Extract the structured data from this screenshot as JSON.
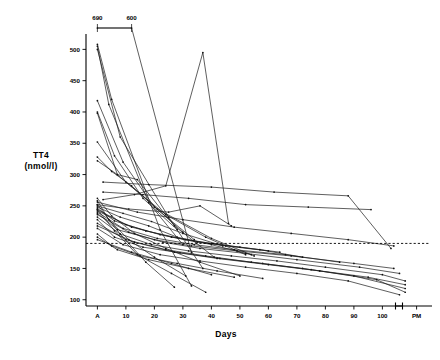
{
  "figure": {
    "kind": "spaghetti-line-chart",
    "background": "#ffffff",
    "ink": "#111111"
  },
  "axes": {
    "y_title_line1": "TT4",
    "y_title_line2": "(nmol/l)",
    "x_title": "Days",
    "y_ticks": [
      100,
      150,
      200,
      250,
      300,
      350,
      400,
      450,
      500
    ],
    "y_tick_labels": [
      "100",
      "150",
      "200",
      "250",
      "300",
      "350",
      "400",
      "450",
      "500"
    ],
    "x_ticks": [
      "A",
      "10",
      "20",
      "30",
      "40",
      "50",
      "60",
      "70",
      "80",
      "90",
      "100",
      "PM"
    ],
    "ylim": [
      90,
      515
    ],
    "xlim": [
      -4,
      116
    ],
    "grid": false,
    "legend": false
  },
  "annotations": {
    "offscale_labels": [
      "690",
      "600"
    ],
    "offscale_note": "two out-of-range values bracketed above the axis",
    "reference_line_value": 190,
    "reference_line_style": "dashed"
  },
  "chart_data": {
    "type": "line",
    "title": "",
    "subtitle": "",
    "xlabel": "Days",
    "ylabel": "TT4 (nmol/l)",
    "xlim": [
      -4,
      116
    ],
    "ylim": [
      90,
      515
    ],
    "grid": false,
    "legend_position": "none",
    "x_tick_labels": [
      "A",
      "10",
      "20",
      "30",
      "40",
      "50",
      "60",
      "70",
      "80",
      "90",
      "100",
      "PM"
    ],
    "x_tick_values": [
      0,
      10,
      20,
      30,
      40,
      50,
      60,
      70,
      80,
      90,
      100,
      112
    ],
    "y_ticks": [
      100,
      150,
      200,
      250,
      300,
      350,
      400,
      450,
      500
    ],
    "reference_lines": [
      {
        "orientation": "horizontal",
        "value": 190,
        "style": "dashed",
        "label": ""
      }
    ],
    "offscale_markers": [
      {
        "x": 0,
        "label": "690",
        "clipped_at": 515
      },
      {
        "x": 12,
        "label": "600",
        "clipped_at": 515
      }
    ],
    "series": [
      {
        "name": "s1",
        "x": [
          0,
          12,
          33
        ],
        "values": [
          690,
          600,
          175
        ]
      },
      {
        "name": "s2",
        "x": [
          0,
          5,
          22,
          33
        ],
        "values": [
          508,
          420,
          212,
          122
        ]
      },
      {
        "name": "s3",
        "x": [
          0,
          4,
          18,
          30
        ],
        "values": [
          505,
          412,
          255,
          188
        ]
      },
      {
        "name": "s4",
        "x": [
          0,
          8,
          25,
          37
        ],
        "values": [
          500,
          360,
          232,
          150
        ]
      },
      {
        "name": "s5",
        "x": [
          0,
          9,
          20,
          34
        ],
        "values": [
          418,
          320,
          248,
          196
        ]
      },
      {
        "name": "s6",
        "x": [
          0,
          6,
          16,
          28
        ],
        "values": [
          400,
          330,
          262,
          212
        ]
      },
      {
        "name": "s7",
        "x": [
          0,
          7,
          21,
          40,
          55
        ],
        "values": [
          398,
          300,
          245,
          198,
          170
        ]
      },
      {
        "name": "s8",
        "x": [
          0,
          10,
          24,
          38,
          52
        ],
        "values": [
          352,
          288,
          236,
          200,
          172
        ]
      },
      {
        "name": "s9",
        "x": [
          0,
          5,
          12,
          30
        ],
        "values": [
          328,
          305,
          282,
          208
        ]
      },
      {
        "name": "s10",
        "x": [
          0,
          7,
          14,
          27,
          41
        ],
        "values": [
          322,
          300,
          292,
          218,
          168
        ]
      },
      {
        "name": "s11",
        "x": [
          2,
          13,
          24,
          37,
          46
        ],
        "values": [
          260,
          268,
          282,
          495,
          222
        ]
      },
      {
        "name": "s12",
        "x": [
          0,
          11,
          25,
          36,
          47
        ],
        "values": [
          252,
          245,
          240,
          250,
          218
        ]
      },
      {
        "name": "s13",
        "x": [
          0,
          9,
          19,
          30,
          44
        ],
        "values": [
          250,
          238,
          225,
          206,
          186
        ]
      },
      {
        "name": "s14",
        "x": [
          0,
          8,
          18,
          28,
          40,
          54
        ],
        "values": [
          248,
          232,
          218,
          200,
          188,
          172
        ]
      },
      {
        "name": "s15",
        "x": [
          0,
          6,
          17,
          31,
          45,
          60
        ],
        "values": [
          246,
          226,
          210,
          196,
          186,
          178
        ]
      },
      {
        "name": "s16",
        "x": [
          0,
          10,
          22,
          35,
          50,
          64
        ],
        "values": [
          244,
          220,
          204,
          192,
          184,
          176
        ]
      },
      {
        "name": "s17",
        "x": [
          0,
          12,
          26,
          40,
          57,
          72
        ],
        "values": [
          242,
          216,
          200,
          190,
          180,
          168
        ]
      },
      {
        "name": "s18",
        "x": [
          0,
          9,
          21,
          34,
          48,
          66,
          85
        ],
        "values": [
          240,
          214,
          198,
          188,
          180,
          172,
          160
        ]
      },
      {
        "name": "s19",
        "x": [
          0,
          7,
          20,
          33,
          49,
          68,
          90,
          104
        ],
        "values": [
          238,
          212,
          196,
          186,
          178,
          170,
          158,
          150
        ]
      },
      {
        "name": "s20",
        "x": [
          0,
          11,
          23,
          36,
          52,
          70,
          92,
          106
        ],
        "values": [
          236,
          208,
          192,
          182,
          174,
          164,
          152,
          142
        ]
      },
      {
        "name": "s21",
        "x": [
          0,
          8,
          19,
          32,
          47,
          63,
          80,
          100,
          108
        ],
        "values": [
          232,
          205,
          188,
          178,
          170,
          162,
          152,
          140,
          130
        ]
      },
      {
        "name": "s22",
        "x": [
          0,
          6,
          16,
          29,
          43,
          58,
          75,
          95,
          108
        ],
        "values": [
          228,
          200,
          184,
          175,
          166,
          158,
          148,
          136,
          124
        ]
      },
      {
        "name": "s23",
        "x": [
          0,
          10,
          24,
          38,
          54,
          72,
          90,
          108
        ],
        "values": [
          222,
          196,
          180,
          170,
          160,
          150,
          138,
          118
        ]
      },
      {
        "name": "s24",
        "x": [
          0,
          13,
          27,
          42,
          60,
          78,
          98,
          108
        ],
        "values": [
          218,
          192,
          176,
          166,
          156,
          146,
          132,
          112
        ]
      },
      {
        "name": "s25",
        "x": [
          0,
          9,
          22,
          36,
          52,
          70,
          88,
          106
        ],
        "values": [
          214,
          188,
          172,
          162,
          152,
          142,
          130,
          108
        ]
      },
      {
        "name": "s26",
        "x": [
          0,
          5,
          15,
          28,
          42,
          58
        ],
        "values": [
          205,
          186,
          170,
          158,
          146,
          134
        ]
      },
      {
        "name": "s27",
        "x": [
          0,
          7,
          18,
          32,
          48
        ],
        "values": [
          200,
          180,
          164,
          150,
          136
        ]
      },
      {
        "name": "s28",
        "x": [
          0,
          12,
          26,
          40
        ],
        "values": [
          196,
          176,
          158,
          140
        ]
      },
      {
        "name": "s29",
        "x": [
          0,
          6,
          14,
          26,
          38
        ],
        "values": [
          244,
          210,
          172,
          142,
          112
        ]
      },
      {
        "name": "s30",
        "x": [
          0,
          8,
          17,
          27
        ],
        "values": [
          252,
          205,
          160,
          120
        ]
      },
      {
        "name": "s31",
        "x": [
          2,
          16,
          32,
          52,
          74,
          96
        ],
        "values": [
          272,
          268,
          262,
          252,
          248,
          244
        ]
      },
      {
        "name": "s32",
        "x": [
          2,
          18,
          40,
          62,
          88,
          103
        ],
        "values": [
          288,
          284,
          280,
          272,
          266,
          182
        ]
      },
      {
        "name": "s33",
        "x": [
          0,
          14,
          30,
          48,
          68,
          88,
          104
        ],
        "values": [
          256,
          240,
          228,
          216,
          206,
          196,
          186
        ]
      },
      {
        "name": "s34",
        "x": [
          0,
          4,
          11,
          20,
          31
        ],
        "values": [
          258,
          228,
          196,
          168,
          138
        ]
      },
      {
        "name": "s35",
        "x": [
          0,
          5,
          13,
          24,
          36,
          50
        ],
        "values": [
          262,
          234,
          206,
          182,
          160,
          138
        ]
      }
    ]
  }
}
